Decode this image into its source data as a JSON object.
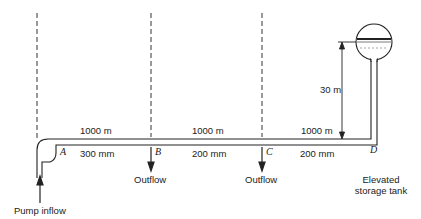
{
  "diagram": {
    "type": "pipe-network",
    "nodes": [
      {
        "id": "A",
        "label": "A"
      },
      {
        "id": "B",
        "label": "B"
      },
      {
        "id": "C",
        "label": "C"
      },
      {
        "id": "D",
        "label": "D"
      }
    ],
    "segments": [
      {
        "from": "A",
        "to": "B",
        "length": "1000 m",
        "diameter": "300 mm"
      },
      {
        "from": "B",
        "to": "C",
        "length": "1000 m",
        "diameter": "200 mm"
      },
      {
        "from": "C",
        "to": "D",
        "length": "1000 m",
        "diameter": "200 mm"
      }
    ],
    "elevation": "30 m",
    "labels": {
      "pump_inflow": "Pump inflow",
      "outflow_b": "Outflow",
      "outflow_c": "Outflow",
      "tank_line1": "Elevated",
      "tank_line2": "storage tank"
    },
    "colors": {
      "line": "#222222",
      "dashed": "#333333",
      "background": "#ffffff"
    }
  }
}
